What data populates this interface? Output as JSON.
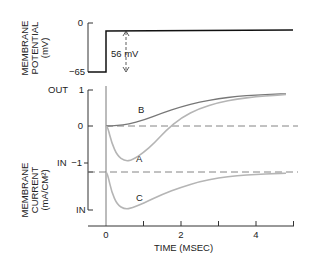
{
  "chart_data": [
    {
      "type": "line",
      "title": "",
      "ylabel_lines": [
        "MEMBRANE",
        "POTENTIAL",
        "(mV)"
      ],
      "yticks": [
        {
          "value": 0,
          "label": "0"
        },
        {
          "value": -65,
          "label": "−65"
        }
      ],
      "ylim": [
        -65,
        0
      ],
      "annotation": "56 mV",
      "series": [
        {
          "name": "voltage-step",
          "points": [
            [
              -0.6,
              -65
            ],
            [
              0,
              -65
            ],
            [
              0,
              -9
            ],
            [
              5.0,
              -8.5
            ]
          ],
          "color": "#111111"
        }
      ]
    },
    {
      "type": "line",
      "ylabel_lines": [
        "MEMBRANE",
        "CURRENT",
        "(mA/CM²)"
      ],
      "yticks": [
        {
          "value": 1,
          "label": "1",
          "side_label": "OUT"
        },
        {
          "value": 0,
          "label": "0"
        },
        {
          "value": -1,
          "label": "−1",
          "side_label": "IN"
        }
      ],
      "lower_trace_ticks": [
        {
          "label": "IN"
        }
      ],
      "ylim": [
        -1.15,
        1
      ],
      "xlabel": "TIME (MSEC)",
      "xticks": [
        {
          "value": 0,
          "label": "0"
        },
        {
          "value": 1,
          "label": ""
        },
        {
          "value": 2,
          "label": "2"
        },
        {
          "value": 3,
          "label": ""
        },
        {
          "value": 4,
          "label": "4"
        },
        {
          "value": 5,
          "label": ""
        }
      ],
      "xlim": [
        -0.6,
        5.0
      ],
      "series": [
        {
          "name": "B",
          "label": "B",
          "color": "#777777",
          "points": [
            [
              0,
              0
            ],
            [
              0.3,
              0.01
            ],
            [
              0.6,
              0.05
            ],
            [
              1.0,
              0.16
            ],
            [
              1.5,
              0.35
            ],
            [
              2.0,
              0.52
            ],
            [
              2.5,
              0.65
            ],
            [
              3.0,
              0.74
            ],
            [
              3.5,
              0.8
            ],
            [
              4.0,
              0.84
            ],
            [
              4.5,
              0.86
            ],
            [
              4.8,
              0.87
            ]
          ]
        },
        {
          "name": "A",
          "label": "A",
          "color": "#b5b5b5",
          "points": [
            [
              0,
              0
            ],
            [
              0.05,
              -0.05
            ],
            [
              0.15,
              -0.45
            ],
            [
              0.3,
              -0.8
            ],
            [
              0.5,
              -0.95
            ],
            [
              0.7,
              -0.92
            ],
            [
              1.0,
              -0.72
            ],
            [
              1.3,
              -0.45
            ],
            [
              1.6,
              -0.12
            ],
            [
              2.0,
              0.22
            ],
            [
              2.5,
              0.48
            ],
            [
              3.0,
              0.63
            ],
            [
              3.5,
              0.73
            ],
            [
              4.0,
              0.79
            ],
            [
              4.5,
              0.83
            ],
            [
              4.8,
              0.85
            ]
          ]
        },
        {
          "name": "C",
          "label": "C",
          "color": "#b5b5b5",
          "baseline": "dashed",
          "points": [
            [
              0,
              0
            ],
            [
              0.05,
              -0.08
            ],
            [
              0.15,
              -0.5
            ],
            [
              0.3,
              -0.82
            ],
            [
              0.5,
              -0.93
            ],
            [
              0.7,
              -0.9
            ],
            [
              1.0,
              -0.78
            ],
            [
              1.5,
              -0.56
            ],
            [
              2.0,
              -0.38
            ],
            [
              2.5,
              -0.24
            ],
            [
              3.0,
              -0.15
            ],
            [
              3.5,
              -0.09
            ],
            [
              4.0,
              -0.06
            ],
            [
              4.5,
              -0.04
            ],
            [
              4.8,
              -0.03
            ]
          ]
        }
      ]
    }
  ],
  "labels": {
    "potential_y0": "0",
    "potential_y65": "−65",
    "step_annotation": "56 mV",
    "out": "OUT",
    "one": "1",
    "zero": "0",
    "in1": "IN",
    "minus_one": "−1",
    "in2": "IN",
    "x0": "0",
    "x2": "2",
    "x4": "4",
    "xlabel": "TIME (MSEC)",
    "A": "A",
    "B": "B",
    "C": "C",
    "pot_l1": "MEMBRANE",
    "pot_l2": "POTENTIAL",
    "pot_l3": "(mV)",
    "cur_l1": "MEMBRANE",
    "cur_l2": "CURRENT",
    "cur_l3": "(mA/CM²)"
  }
}
